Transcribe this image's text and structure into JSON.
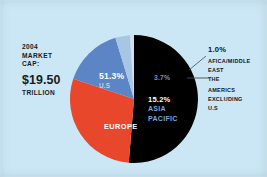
{
  "caption": {
    "line1": "2004",
    "line2": "MARKET",
    "line3": "CAP:",
    "amount": "$19.50",
    "line4": "TRILLION"
  },
  "callouts": {
    "africa_pct": "1.0%",
    "africa_line1": "AFICA/MIDDLE",
    "africa_line2": "EAST",
    "americas_line1": "THE",
    "americas_line2": "AMERICS",
    "americas_line3": "EXCLUDING",
    "americas_line4": "U.S"
  },
  "colors": {
    "background": "#cbe7f5",
    "us": "#000000",
    "europe": "#e8472c",
    "asia_pacific": "#5b85c5",
    "americas_ex_us": "#a8c6e4",
    "africa_middle_east": "#cfe0f0",
    "label_light": "#ffffff",
    "text_dark": "#13131c"
  },
  "chart_data": {
    "type": "pie",
    "title": "2004 MARKET CAP: $19.50 TRILLION",
    "total_label": "$19.50 TRILLION",
    "categories": [
      "U.S",
      "EUROPE",
      "ASIA PACIFIC",
      "THE AMERICS EXCLUDING U.S",
      "AFICA/MIDDLE EAST"
    ],
    "values": [
      51.3,
      28.8,
      15.2,
      3.7,
      1.0
    ],
    "unit": "%",
    "labels": {
      "us_pct": "51.3%",
      "us_name": "U.S",
      "europe_pct": "28.8%",
      "europe_name": "EUROPE",
      "asia_pct": "15.2%",
      "asia_name_line1": "ASIA",
      "asia_name_line2": "PACIFIC",
      "americas_pct": "3.7%",
      "africa_pct": "1.0%"
    },
    "colors": [
      "#000000",
      "#e8472c",
      "#5b85c5",
      "#a8c6e4",
      "#cfe0f0"
    ],
    "legend": "callouts-right",
    "grid": false
  }
}
